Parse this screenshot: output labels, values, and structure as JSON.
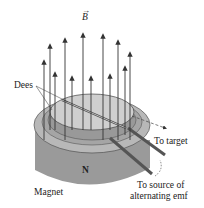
{
  "diagram": {
    "labels": {
      "field": "B",
      "dees": "Dees",
      "target": "To target",
      "pole": "N",
      "magnet": "Magnet",
      "source_line1": "To source of",
      "source_line2": "alternating emf"
    }
  }
}
